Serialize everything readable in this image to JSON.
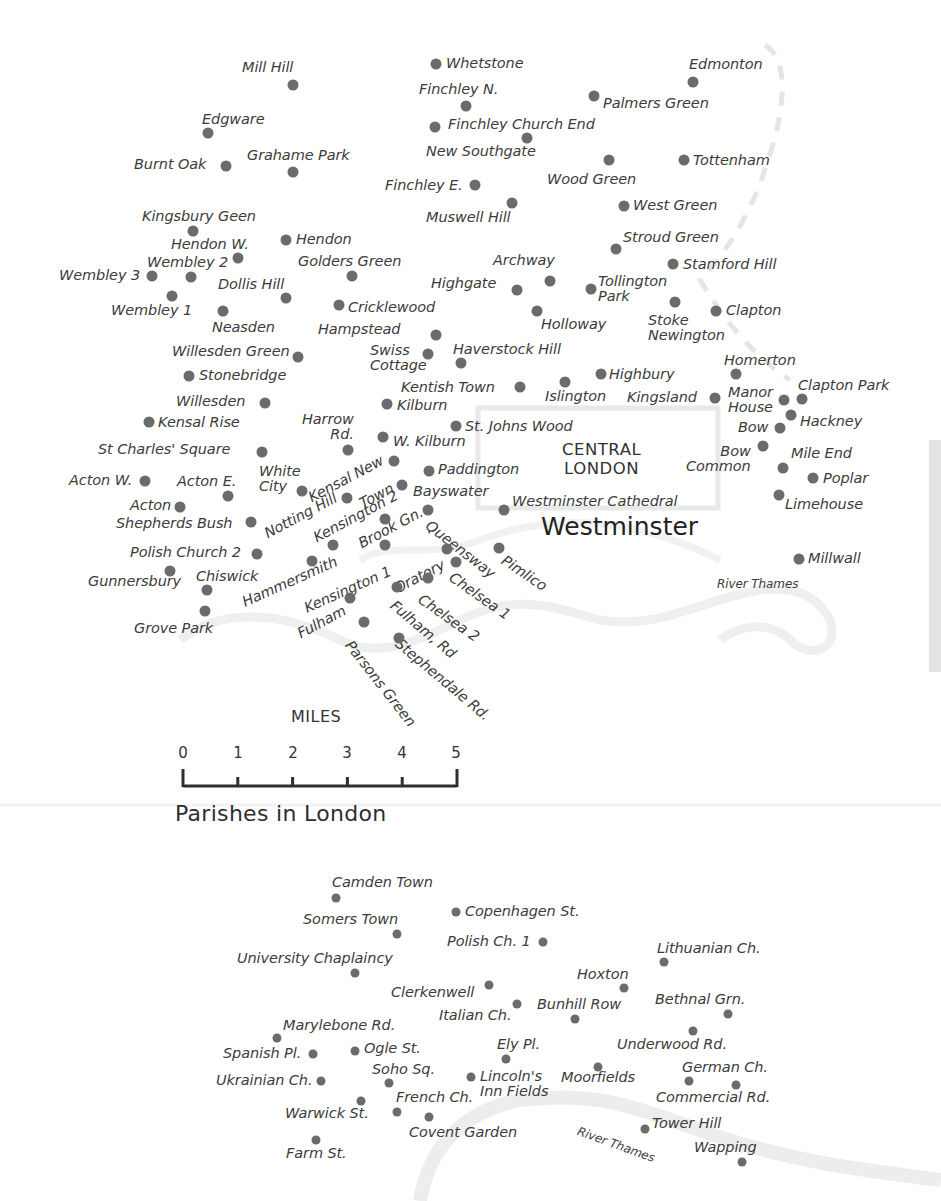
{
  "map": {
    "title": "Parishes in London",
    "central_label": "CENTRAL\nLONDON",
    "westminster_label": "Westminster",
    "river_label_main": "River Thames",
    "river_label_inset": "River Thames",
    "scale": {
      "title": "MILES",
      "ticks": [
        "0",
        "1",
        "2",
        "3",
        "4",
        "5"
      ]
    },
    "colors": {
      "dot": "#6b6b6b",
      "text": "#3c3c3c",
      "river": "#ececec",
      "boundary": "#e6e6e6"
    }
  },
  "places": [
    {
      "name": "Mill Hill",
      "dot": [
        293,
        85
      ],
      "label": [
        242,
        60
      ]
    },
    {
      "name": "Whetstone",
      "dot": [
        436,
        64
      ],
      "label": [
        446,
        56
      ]
    },
    {
      "name": "Edmonton",
      "dot": [
        693,
        82
      ],
      "label": [
        689,
        57
      ]
    },
    {
      "name": "Finchley N.",
      "dot": [
        466,
        106
      ],
      "label": [
        419,
        82
      ]
    },
    {
      "name": "Palmers Green",
      "dot": [
        594,
        96
      ],
      "label": [
        603,
        96
      ]
    },
    {
      "name": "Edgware",
      "dot": [
        208,
        133
      ],
      "label": [
        202,
        112
      ]
    },
    {
      "name": "Finchley Church End",
      "dot": [
        435,
        127
      ],
      "label": [
        448,
        117
      ]
    },
    {
      "name": "New Southgate",
      "dot": [
        527,
        138
      ],
      "label": [
        426,
        144
      ]
    },
    {
      "name": "Burnt Oak",
      "dot": [
        226,
        166
      ],
      "label": [
        134,
        157
      ]
    },
    {
      "name": "Grahame Park",
      "dot": [
        293,
        172
      ],
      "label": [
        247,
        148
      ]
    },
    {
      "name": "Wood Green",
      "dot": [
        609,
        160
      ],
      "label": [
        547,
        172
      ]
    },
    {
      "name": "Tottenham",
      "dot": [
        684,
        160
      ],
      "label": [
        693,
        153
      ]
    },
    {
      "name": "Finchley E.",
      "dot": [
        475,
        185
      ],
      "label": [
        385,
        178
      ]
    },
    {
      "name": "Muswell Hill",
      "dot": [
        512,
        203
      ],
      "label": [
        426,
        210
      ]
    },
    {
      "name": "West Green",
      "dot": [
        624,
        206
      ],
      "label": [
        633,
        198
      ]
    },
    {
      "name": "Kingsbury Geen",
      "dot": [
        193,
        231
      ],
      "label": [
        142,
        209
      ]
    },
    {
      "name": "Hendon",
      "dot": [
        286,
        240
      ],
      "label": [
        296,
        232
      ]
    },
    {
      "name": "Stroud Green",
      "dot": [
        616,
        249
      ],
      "label": [
        623,
        230
      ]
    },
    {
      "name": "Hendon W.",
      "dot": [
        238,
        258
      ],
      "label": [
        171,
        237
      ]
    },
    {
      "name": "Wembley 2",
      "dot": [
        191,
        277
      ],
      "label": [
        147,
        255
      ]
    },
    {
      "name": "Golders Green",
      "dot": [
        352,
        276
      ],
      "label": [
        298,
        254
      ]
    },
    {
      "name": "Archway",
      "dot": [
        550,
        281
      ],
      "label": [
        493,
        253
      ]
    },
    {
      "name": "Stamford Hill",
      "dot": [
        673,
        264
      ],
      "label": [
        683,
        257
      ]
    },
    {
      "name": "Wembley 3",
      "dot": [
        152,
        276
      ],
      "label": [
        59,
        268
      ]
    },
    {
      "name": "Dollis Hill",
      "dot": [
        286,
        298
      ],
      "label": [
        218,
        277
      ]
    },
    {
      "name": "Highgate",
      "dot": [
        517,
        290
      ],
      "label": [
        431,
        276
      ]
    },
    {
      "name": "Tollington\nPark",
      "dot": [
        591,
        289
      ],
      "label": [
        598,
        274
      ],
      "multi": true
    },
    {
      "name": "Wembley 1",
      "dot": [
        172,
        296
      ],
      "label": [
        111,
        303
      ]
    },
    {
      "name": "Cricklewood",
      "dot": [
        339,
        305
      ],
      "label": [
        348,
        300
      ]
    },
    {
      "name": "Holloway",
      "dot": [
        537,
        311
      ],
      "label": [
        541,
        317
      ]
    },
    {
      "name": "Stoke\nNewington",
      "dot": [
        675,
        302
      ],
      "label": [
        648,
        313
      ],
      "multi": true
    },
    {
      "name": "Clapton",
      "dot": [
        716,
        311
      ],
      "label": [
        726,
        303
      ]
    },
    {
      "name": "Neasden",
      "dot": [
        223,
        311
      ],
      "label": [
        212,
        320
      ]
    },
    {
      "name": "Hampstead",
      "dot": [
        436,
        335
      ],
      "label": [
        318,
        322
      ]
    },
    {
      "name": "Swiss\nCottage",
      "dot": [
        428,
        354
      ],
      "label": [
        370,
        343
      ],
      "multi": true
    },
    {
      "name": "Haverstock Hill",
      "dot": [
        461,
        363
      ],
      "label": [
        453,
        342
      ]
    },
    {
      "name": "Willesden Green",
      "dot": [
        298,
        357
      ],
      "label": [
        172,
        344
      ]
    },
    {
      "name": "Homerton",
      "dot": [
        736,
        374
      ],
      "label": [
        724,
        353
      ]
    },
    {
      "name": "Stonebridge",
      "dot": [
        189,
        376
      ],
      "label": [
        199,
        368
      ]
    },
    {
      "name": "Highbury",
      "dot": [
        601,
        374
      ],
      "label": [
        609,
        367
      ]
    },
    {
      "name": "Kentish Town",
      "dot": [
        520,
        387
      ],
      "label": [
        401,
        380
      ]
    },
    {
      "name": "Islington",
      "dot": [
        565,
        382
      ],
      "label": [
        545,
        389
      ]
    },
    {
      "name": "Kingsland",
      "dot": [
        715,
        398
      ],
      "label": [
        627,
        390
      ]
    },
    {
      "name": "Manor\nHouse",
      "dot": [
        784,
        400
      ],
      "label": [
        728,
        385
      ],
      "multi": true
    },
    {
      "name": "Clapton Park",
      "dot": [
        802,
        399
      ],
      "label": [
        798,
        378
      ]
    },
    {
      "name": "Willesden",
      "dot": [
        265,
        403
      ],
      "label": [
        176,
        394
      ]
    },
    {
      "name": "Kilburn",
      "dot": [
        387,
        404
      ],
      "label": [
        397,
        398
      ]
    },
    {
      "name": "Hackney",
      "dot": [
        791,
        415
      ],
      "label": [
        800,
        414
      ]
    },
    {
      "name": "Kensal Rise",
      "dot": [
        149,
        422
      ],
      "label": [
        158,
        415
      ]
    },
    {
      "name": "St. Johns Wood",
      "dot": [
        456,
        426
      ],
      "label": [
        465,
        419
      ]
    },
    {
      "name": "Bow",
      "dot": [
        780,
        428
      ],
      "label": [
        738,
        420
      ]
    },
    {
      "name": "Harrow\nRd.",
      "dot": [
        348,
        450
      ],
      "label": [
        302,
        412
      ],
      "multi": true,
      "align": "right"
    },
    {
      "name": "W. Kilburn",
      "dot": [
        383,
        437
      ],
      "label": [
        393,
        434
      ]
    },
    {
      "name": "St Charles' Square",
      "dot": [
        262,
        452
      ],
      "label": [
        98,
        442
      ]
    },
    {
      "name": "Bow\nCommon",
      "dot": [
        763,
        446
      ],
      "label": [
        686,
        444
      ],
      "multi": true,
      "align": "right"
    },
    {
      "name": "Mile End",
      "dot": [
        783,
        468
      ],
      "label": [
        791,
        446
      ]
    },
    {
      "name": "Paddington",
      "dot": [
        429,
        471
      ],
      "label": [
        438,
        462
      ]
    },
    {
      "name": "Poplar",
      "dot": [
        813,
        478
      ],
      "label": [
        823,
        471
      ]
    },
    {
      "name": "Acton W.",
      "dot": [
        145,
        481
      ],
      "label": [
        69,
        473
      ]
    },
    {
      "name": "Acton E.",
      "dot": [
        228,
        496
      ],
      "label": [
        177,
        474
      ]
    },
    {
      "name": "White\nCity",
      "dot": [
        302,
        491
      ],
      "label": [
        259,
        464
      ],
      "multi": true
    },
    {
      "name": "Bayswater",
      "dot": [
        402,
        485
      ],
      "label": [
        413,
        484
      ]
    },
    {
      "name": "Limehouse",
      "dot": [
        779,
        495
      ],
      "label": [
        785,
        497
      ]
    },
    {
      "name": "Westminster Cathedral",
      "dot": [
        504,
        510
      ],
      "label": [
        512,
        494
      ]
    },
    {
      "name": "Acton",
      "dot": [
        180,
        507
      ],
      "label": [
        130,
        498
      ]
    },
    {
      "name": "Shepherds Bush",
      "dot": [
        251,
        522
      ],
      "label": [
        116,
        516
      ]
    },
    {
      "name": "Polish Church 2",
      "dot": [
        257,
        554
      ],
      "label": [
        130,
        545
      ]
    },
    {
      "name": "Gunnersbury",
      "dot": [
        170,
        571
      ],
      "label": [
        88,
        574
      ]
    },
    {
      "name": "Chiswick",
      "dot": [
        207,
        590
      ],
      "label": [
        196,
        569
      ]
    },
    {
      "name": "Grove Park",
      "dot": [
        205,
        611
      ],
      "label": [
        134,
        621
      ]
    },
    {
      "name": "Pimlico",
      "dot": [
        499,
        548
      ],
      "label": [
        0,
        0
      ],
      "rot": {
        "text": "Pimlico",
        "x": 507,
        "y": 553,
        "deg": 34
      }
    },
    {
      "name": "Millwall",
      "dot": [
        799,
        559
      ],
      "label": [
        808,
        551
      ]
    }
  ],
  "rotated_labels": [
    {
      "text": "Kensal New",
      "x": 306,
      "y": 492,
      "deg": -28
    },
    {
      "text": "Town",
      "x": 357,
      "y": 498,
      "deg": -28
    },
    {
      "text": "Notting Hill",
      "x": 262,
      "y": 528,
      "deg": -28
    },
    {
      "text": "Kensington 2",
      "x": 311,
      "y": 532,
      "deg": -28
    },
    {
      "text": "Brook Gn.",
      "x": 356,
      "y": 538,
      "deg": -28
    },
    {
      "text": "Hammersmith",
      "x": 240,
      "y": 596,
      "deg": -24
    },
    {
      "text": "Kensington 1",
      "x": 302,
      "y": 602,
      "deg": -24
    },
    {
      "text": "Fulham",
      "x": 295,
      "y": 628,
      "deg": -28
    },
    {
      "text": "Oratory",
      "x": 392,
      "y": 583,
      "deg": -28
    },
    {
      "text": "Queensway",
      "x": 432,
      "y": 518,
      "deg": 38
    },
    {
      "text": "Chelsea 1",
      "x": 455,
      "y": 570,
      "deg": 35
    },
    {
      "text": "Chelsea 2",
      "x": 424,
      "y": 592,
      "deg": 35
    },
    {
      "text": "Fulham, Rd",
      "x": 397,
      "y": 598,
      "deg": 40
    },
    {
      "text": "Stephendale Rd.",
      "x": 402,
      "y": 636,
      "deg": 40
    },
    {
      "text": "Parsons Green",
      "x": 354,
      "y": 638,
      "deg": 52
    }
  ],
  "rotated_dots": [
    [
      394,
      461
    ],
    [
      347,
      498
    ],
    [
      385,
      519
    ],
    [
      333,
      545
    ],
    [
      385,
      545
    ],
    [
      312,
      561
    ],
    [
      428,
      510
    ],
    [
      447,
      549
    ],
    [
      456,
      562
    ],
    [
      428,
      578
    ],
    [
      397,
      587
    ],
    [
      350,
      598
    ],
    [
      364,
      622
    ],
    [
      399,
      638
    ]
  ],
  "inset_places": [
    {
      "name": "Camden Town",
      "dot": [
        336,
        898
      ],
      "label": [
        332,
        875
      ]
    },
    {
      "name": "Copenhagen St.",
      "dot": [
        456,
        912
      ],
      "label": [
        465,
        904
      ]
    },
    {
      "name": "Somers Town",
      "dot": [
        397,
        934
      ],
      "label": [
        303,
        912
      ]
    },
    {
      "name": "Polish Ch. 1",
      "dot": [
        543,
        942
      ],
      "label": [
        447,
        934
      ]
    },
    {
      "name": "University Chaplaincy",
      "dot": [
        355,
        973
      ],
      "label": [
        237,
        951
      ]
    },
    {
      "name": "Lithuanian Ch.",
      "dot": [
        664,
        962
      ],
      "label": [
        657,
        941
      ]
    },
    {
      "name": "Hoxton",
      "dot": [
        624,
        988
      ],
      "label": [
        577,
        967
      ]
    },
    {
      "name": "Clerkenwell",
      "dot": [
        489,
        985
      ],
      "label": [
        391,
        985
      ]
    },
    {
      "name": "Bunhill Row",
      "dot": [
        575,
        1019
      ],
      "label": [
        537,
        997
      ]
    },
    {
      "name": "Italian Ch.",
      "dot": [
        517,
        1004
      ],
      "label": [
        439,
        1008
      ]
    },
    {
      "name": "Bethnal Grn.",
      "dot": [
        728,
        1014
      ],
      "label": [
        655,
        992
      ]
    },
    {
      "name": "Marylebone Rd.",
      "dot": [
        277,
        1038
      ],
      "label": [
        283,
        1018
      ]
    },
    {
      "name": "Underwood Rd.",
      "dot": [
        693,
        1031
      ],
      "label": [
        617,
        1037
      ]
    },
    {
      "name": "Ely Pl.",
      "dot": [
        506,
        1059
      ],
      "label": [
        497,
        1037
      ]
    },
    {
      "name": "Spanish Pl.",
      "dot": [
        313,
        1054
      ],
      "label": [
        223,
        1046
      ]
    },
    {
      "name": "Ogle St.",
      "dot": [
        355,
        1051
      ],
      "label": [
        364,
        1041
      ]
    },
    {
      "name": "Moorfields",
      "dot": [
        598,
        1067
      ],
      "label": [
        561,
        1070
      ]
    },
    {
      "name": "German Ch.",
      "dot": [
        689,
        1081
      ],
      "label": [
        682,
        1060
      ]
    },
    {
      "name": "Soho Sq.",
      "dot": [
        389,
        1083
      ],
      "label": [
        372,
        1062
      ]
    },
    {
      "name": "Lincoln's\nInn Fields",
      "dot": [
        471,
        1077
      ],
      "label": [
        480,
        1069
      ],
      "multi": true
    },
    {
      "name": "Ukrainian Ch.",
      "dot": [
        321,
        1081
      ],
      "label": [
        216,
        1073
      ]
    },
    {
      "name": "Commercial Rd.",
      "dot": [
        736,
        1085
      ],
      "label": [
        656,
        1090
      ]
    },
    {
      "name": "French Ch.",
      "dot": [
        397,
        1112
      ],
      "label": [
        396,
        1090
      ]
    },
    {
      "name": "Warwick St.",
      "dot": [
        361,
        1101
      ],
      "label": [
        285,
        1106
      ]
    },
    {
      "name": "Covent Garden",
      "dot": [
        429,
        1117
      ],
      "label": [
        409,
        1125
      ]
    },
    {
      "name": "Tower Hill",
      "dot": [
        645,
        1129
      ],
      "label": [
        652,
        1116
      ]
    },
    {
      "name": "Farm St.",
      "dot": [
        316,
        1140
      ],
      "label": [
        286,
        1146
      ]
    },
    {
      "name": "Wapping",
      "dot": [
        742,
        1162
      ],
      "label": [
        694,
        1140
      ]
    }
  ]
}
